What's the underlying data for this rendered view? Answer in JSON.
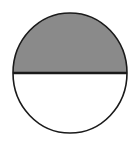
{
  "figure": {
    "name": "half-shaded-circle",
    "type": "fraction-area-diagram",
    "shape": "circle",
    "canvas": {
      "width": 137,
      "height": 144,
      "background_color": "#ffffff"
    },
    "geometry": {
      "center_x": 70,
      "center_y": 73,
      "radius_x": 57,
      "radius_y": 60,
      "left_edge_x": 13,
      "right_edge_x": 127,
      "top_edge_y": 13,
      "bottom_edge_y": 133,
      "divider_y": 73
    },
    "outline": {
      "color": "#1a1a1a",
      "width": 1.6
    },
    "divider": {
      "color": "#1a1a1a",
      "width": 2.4,
      "orientation": "horizontal",
      "from_x": 13,
      "to_x": 127
    },
    "parts": [
      {
        "id": "upper-half",
        "label": "top half",
        "position": "top",
        "shaded": true,
        "fill_color": "#8a8a8a"
      },
      {
        "id": "lower-half",
        "label": "bottom half",
        "position": "bottom",
        "shaded": false,
        "fill_color": "#ffffff"
      }
    ],
    "fraction": {
      "shaded_parts": 1,
      "total_parts": 2,
      "value": "1/2",
      "percent": 50
    }
  },
  "chart_data": {
    "type": "pie",
    "title": "",
    "categories": [
      "shaded",
      "unshaded"
    ],
    "values": [
      50,
      50
    ],
    "colors": [
      "#8a8a8a",
      "#ffffff"
    ],
    "labels_shown": false,
    "legend": "none"
  }
}
